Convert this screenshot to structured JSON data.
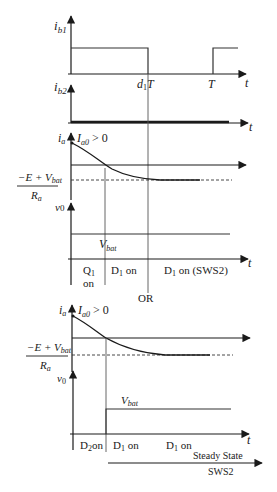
{
  "diagram": {
    "type": "timing-waveforms",
    "panels": [
      {
        "id": "ib1",
        "axis_label": "i",
        "axis_label_sub": "b1",
        "x_label": "t",
        "ticks": [
          {
            "label": "d",
            "sub": "1",
            "suffix": "T"
          },
          {
            "label": "T"
          }
        ]
      },
      {
        "id": "ib2",
        "axis_label": "i",
        "axis_label_sub": "b2",
        "x_label": "t"
      },
      {
        "id": "ia-upper",
        "axis_label": "i",
        "axis_label_sub": "a",
        "initial_condition": {
          "main": "I",
          "sub": "a0",
          "rest": " > 0"
        },
        "asymptote_label": {
          "numerator": "−E + V",
          "numerator_sub": "bat",
          "denominator": "R",
          "denominator_sub": "a"
        }
      },
      {
        "id": "v0-upper",
        "axis_label": "v",
        "axis_label_sub": "0",
        "x_label": "t",
        "level_label": {
          "main": "V",
          "sub": "bat"
        },
        "intervals": [
          {
            "line1": "Q",
            "line1_sub": "1",
            "line2": "on"
          },
          {
            "text": "D",
            "sub": "1",
            "rest": " on"
          },
          {
            "text": "D",
            "sub": "1",
            "rest": " on (SWS2)"
          }
        ]
      },
      {
        "id": "separator",
        "text": "OR"
      },
      {
        "id": "ia-lower",
        "axis_label": "i",
        "axis_label_sub": "a",
        "initial_condition": {
          "main": "I",
          "sub": "a0",
          "rest": " > 0"
        },
        "asymptote_label": {
          "numerator": "−E + V",
          "numerator_sub": "bat",
          "denominator": "R",
          "denominator_sub": "a"
        }
      },
      {
        "id": "v0-lower",
        "axis_label": "v",
        "axis_label_sub": "0",
        "x_label": "t",
        "level_label": {
          "main": "V",
          "sub": "bat"
        },
        "intervals": [
          {
            "text": "D",
            "sub": "2",
            "rest": "on"
          },
          {
            "text": "D",
            "sub": "1",
            "rest": " on"
          },
          {
            "text": "D",
            "sub": "1",
            "rest": " on"
          }
        ],
        "steady_state": {
          "line1": "Steady State",
          "line2": "SWS2"
        }
      }
    ]
  }
}
